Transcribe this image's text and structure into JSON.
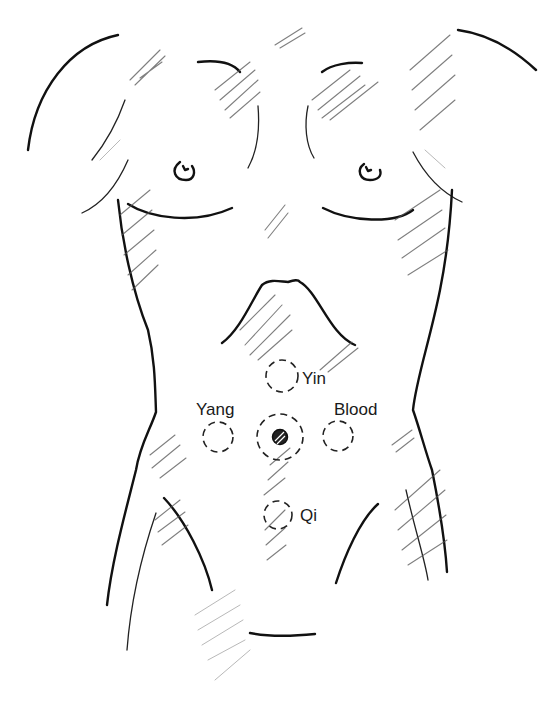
{
  "figure": {
    "points": [
      {
        "id": "yin",
        "label": "Yin"
      },
      {
        "id": "yang",
        "label": "Yang"
      },
      {
        "id": "blood",
        "label": "Blood"
      },
      {
        "id": "qi",
        "label": "Qi"
      },
      {
        "id": "navel",
        "label": ""
      }
    ]
  },
  "colors": {
    "line": "#111111",
    "hatch": "#555555",
    "background": "#ffffff"
  }
}
